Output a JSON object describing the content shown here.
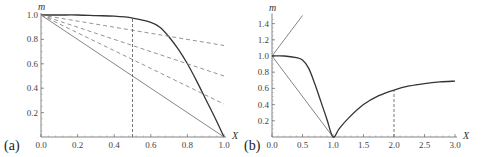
{
  "chart_data": [
    {
      "panel": "(a)",
      "type": "line",
      "xlabel": "X",
      "ylabel": "m",
      "xlim": [
        0,
        1.0
      ],
      "ylim": [
        0,
        1.0
      ],
      "xticks": [
        "0.0",
        "0.2",
        "0.4",
        "0.6",
        "0.8",
        "1.0"
      ],
      "yticks": [
        "0.2",
        "0.4",
        "0.6",
        "0.8",
        "1.0"
      ],
      "grid": false,
      "series": [
        {
          "name": "dark curve",
          "style": "solid-dark",
          "x": [
            0,
            0.1,
            0.2,
            0.3,
            0.4,
            0.5,
            0.6,
            0.65,
            0.7,
            0.75,
            0.8,
            0.85,
            0.9,
            0.95,
            1.0
          ],
          "y": [
            1.0,
            1.0,
            1.0,
            0.995,
            0.99,
            0.975,
            0.94,
            0.9,
            0.82,
            0.72,
            0.6,
            0.46,
            0.31,
            0.16,
            0.0
          ]
        },
        {
          "name": "straight line",
          "style": "solid-gray",
          "x": [
            0,
            1.0
          ],
          "y": [
            1.0,
            0.0
          ]
        },
        {
          "name": "dashed 1",
          "style": "dashed",
          "x": [
            0,
            1.0
          ],
          "y": [
            1.0,
            0.75
          ]
        },
        {
          "name": "dashed 2",
          "style": "dashed",
          "x": [
            0,
            1.0
          ],
          "y": [
            1.0,
            0.5
          ]
        },
        {
          "name": "dashed 3",
          "style": "dashed",
          "x": [
            0,
            1.0
          ],
          "y": [
            1.0,
            0.27
          ]
        },
        {
          "name": "vertical marker",
          "style": "dashed-vertical",
          "x": [
            0.5,
            0.5
          ],
          "y": [
            0.0,
            0.975
          ]
        }
      ]
    },
    {
      "panel": "(b)",
      "type": "line",
      "xlabel": "X",
      "ylabel": "m",
      "xlim": [
        0,
        3.0
      ],
      "ylim": [
        0,
        1.5
      ],
      "xticks": [
        "0.0",
        "0.5",
        "1.0",
        "1.5",
        "2.0",
        "2.5",
        "3.0"
      ],
      "yticks": [
        "0.2",
        "0.4",
        "0.6",
        "0.8",
        "1.0",
        "1.2",
        "1.4"
      ],
      "grid": false,
      "series": [
        {
          "name": "rising line",
          "style": "solid-gray",
          "x": [
            0,
            0.5
          ],
          "y": [
            1.0,
            1.5
          ]
        },
        {
          "name": "falling line",
          "style": "solid-gray",
          "x": [
            0,
            1.0
          ],
          "y": [
            1.0,
            0.0
          ]
        },
        {
          "name": "dark curve",
          "style": "solid-dark",
          "x": [
            0,
            0.2,
            0.4,
            0.5,
            0.6,
            0.7,
            0.8,
            0.9,
            1.0,
            1.1,
            1.25,
            1.5,
            1.75,
            2.0,
            2.25,
            2.5,
            2.75,
            3.0
          ],
          "y": [
            1.0,
            1.0,
            0.98,
            0.95,
            0.85,
            0.66,
            0.44,
            0.22,
            0.0,
            0.1,
            0.23,
            0.4,
            0.51,
            0.58,
            0.63,
            0.66,
            0.68,
            0.69
          ]
        },
        {
          "name": "vertical marker",
          "style": "dashed-vertical",
          "x": [
            2.0,
            2.0
          ],
          "y": [
            0.0,
            0.58
          ]
        }
      ]
    }
  ],
  "labels": {
    "panel_a": "(a)",
    "panel_b": "(b)",
    "x_axis": "X",
    "y_axis": "m"
  }
}
